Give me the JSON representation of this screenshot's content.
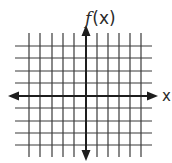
{
  "diagram": {
    "type": "coordinate-grid",
    "y_axis_label_func": "f",
    "y_axis_label_arg": "(x)",
    "x_axis_label": "x",
    "vertical_lines": [
      29,
      40,
      52,
      63,
      74,
      97,
      108,
      119,
      130,
      141
    ],
    "horizontal_lines": [
      46,
      58,
      71,
      83,
      108,
      121,
      133,
      145
    ],
    "grid_extent": {
      "left": 15,
      "right": 152,
      "top": 33,
      "bottom": 157
    },
    "x_axis": {
      "y": 96,
      "left_tip": 8,
      "right_tip": 158
    },
    "y_axis": {
      "x": 86,
      "top_tip": 25,
      "bottom_tip": 161
    },
    "colors": {
      "grid": "#3a3a3a",
      "axis": "#1e1e1e",
      "background": "#ffffff"
    }
  }
}
